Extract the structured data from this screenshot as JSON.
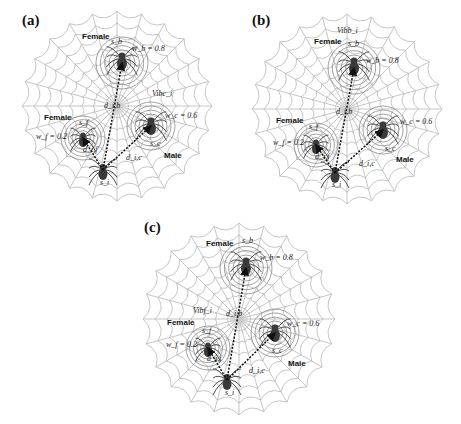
{
  "figure": {
    "panels": [
      {
        "id": "a",
        "label": "(a)",
        "vibration_label": "Vibc_i",
        "vibration_holder": "male",
        "spiders": {
          "top": {
            "sex": "Female",
            "name": "s_b",
            "weight": "w_b = 0.8"
          },
          "left": {
            "sex": "Female",
            "name": "s_f",
            "weight": "w_f = 0.2"
          },
          "right": {
            "sex": "Male",
            "name": "s_c",
            "weight": "w_c = 0.6"
          },
          "bottom": {
            "name": "s_i"
          }
        },
        "distances": {
          "to_top": "d_i,b",
          "to_left": "d_i,f",
          "to_right": "d_i,c"
        }
      },
      {
        "id": "b",
        "label": "(b)",
        "vibration_label": "Vibb_i",
        "vibration_holder": "top",
        "spiders": {
          "top": {
            "sex": "Female",
            "name": "s_b",
            "weight": "w_b = 0.8"
          },
          "left": {
            "sex": "Female",
            "name": "s_f",
            "weight": "w_f = 0.2"
          },
          "right": {
            "sex": "Male",
            "name": "s_c",
            "weight": "w_c = 0.6"
          },
          "bottom": {
            "name": "s_i"
          }
        },
        "distances": {
          "to_top": "d_i,b",
          "to_left": "d_i,f",
          "to_right": "d_i,c"
        }
      },
      {
        "id": "c",
        "label": "(c)",
        "vibration_label": "Vibf_i",
        "vibration_holder": "left",
        "spiders": {
          "top": {
            "sex": "Female",
            "name": "s_b",
            "weight": "w_b = 0.8"
          },
          "left": {
            "sex": "Female",
            "name": "s_f",
            "weight": "w_f = 0.2"
          },
          "right": {
            "sex": "Male",
            "name": "s_c",
            "weight": "w_c = 0.6"
          },
          "bottom": {
            "name": "s_i"
          }
        },
        "distances": {
          "to_top": "d_i,b",
          "to_left": "d_i,f",
          "to_right": "d_i,c"
        }
      }
    ]
  },
  "colors": {
    "web": "#b8b8b8",
    "ring": "#8a8a8a",
    "spider": "#3a3a3a",
    "arrow": "#111111",
    "background": "#ffffff"
  }
}
